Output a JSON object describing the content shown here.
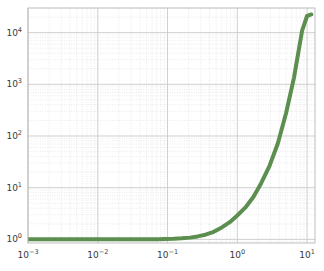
{
  "chart_data": {
    "type": "line",
    "title": "",
    "xlabel": "",
    "ylabel": "",
    "xscale": "log",
    "yscale": "log",
    "xlim": [
      0.001,
      13.0
    ],
    "ylim": [
      0.85,
      30000
    ],
    "grid": true,
    "grid_minor": true,
    "legend": null,
    "xticks": [
      0.001,
      0.01,
      0.1,
      1,
      10
    ],
    "xtick_labels": [
      "10−3",
      "10−2",
      "10−1",
      "10⁰",
      "10¹"
    ],
    "yticks": [
      1,
      10,
      100,
      1000,
      10000
    ],
    "ytick_labels": [
      "10⁰",
      "10¹",
      "10²",
      "10³",
      "10⁴"
    ],
    "series": [
      {
        "name": "curve",
        "color": "#5c8f4f",
        "linewidth": 4,
        "x": [
          0.001,
          0.0013,
          0.0017,
          0.0022,
          0.0029,
          0.0038,
          0.005,
          0.0065,
          0.0085,
          0.011,
          0.0145,
          0.019,
          0.025,
          0.032,
          0.042,
          0.055,
          0.072,
          0.094,
          0.123,
          0.16,
          0.21,
          0.27,
          0.35,
          0.46,
          0.6,
          0.78,
          1.0,
          1.3,
          1.7,
          2.2,
          2.9,
          3.8,
          5.0,
          6.5,
          8.5,
          10.0,
          11.0,
          11.5
        ],
        "y": [
          1.0,
          1.0,
          1.0,
          1.0,
          1.0,
          1.0,
          1.0,
          1.0,
          1.0,
          1.0,
          1.0,
          1.0,
          1.0,
          1.001,
          1.002,
          1.004,
          1.008,
          1.014,
          1.025,
          1.045,
          1.08,
          1.14,
          1.23,
          1.4,
          1.7,
          2.15,
          2.9,
          4.1,
          6.6,
          12.2,
          26.5,
          71,
          275,
          1350,
          11000,
          21000,
          22000,
          22500
        ]
      }
    ],
    "colors": {
      "line": "#5c8f4f",
      "grid_major": "#c9c9c9",
      "grid_minor": "#dcdcdc",
      "axis": "#b8b8b8",
      "tick_text": "#3a3a3a",
      "background": "#ffffff"
    }
  },
  "axes": {
    "x_tick_positions_px": [
      48.5,
      115.0,
      181.5,
      248.0,
      314.5
    ],
    "y_tick_positions_px": [
      238.0,
      181.0,
      124.0,
      67.0,
      10.0
    ]
  }
}
